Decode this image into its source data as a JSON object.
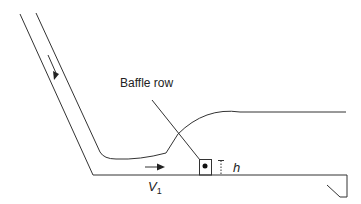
{
  "diagram": {
    "type": "stilling-basin-cross-section",
    "labels": {
      "baffle_row": "Baffle row",
      "velocity_symbol": "V",
      "velocity_subscript": "1",
      "height_symbol": "h"
    },
    "elements": [
      {
        "name": "chute",
        "description": "Inclined spillway chute walls"
      },
      {
        "name": "flow-direction-arrow-chute",
        "description": "Arrow pointing down the chute"
      },
      {
        "name": "flow-direction-arrow-basin",
        "description": "Arrow pointing right along basin floor"
      },
      {
        "name": "water-surface",
        "description": "Hydraulic jump profile rising to tailwater level"
      },
      {
        "name": "baffle-block",
        "description": "Block on basin floor with dot"
      },
      {
        "name": "height-dimension",
        "description": "Dimension marker for baffle height h"
      },
      {
        "name": "end-sill",
        "description": "Sloped end sill at basin exit"
      }
    ],
    "colors": {
      "line": "#333333",
      "text": "#222222",
      "background": "#ffffff"
    }
  }
}
